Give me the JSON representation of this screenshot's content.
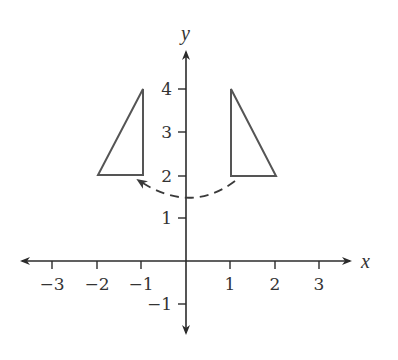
{
  "diagram": {
    "type": "coordinate-plane-reflection",
    "axes": {
      "x_label": "x",
      "y_label": "y",
      "x_ticks": [
        {
          "value": -3,
          "label": "−3"
        },
        {
          "value": -2,
          "label": "−2"
        },
        {
          "value": -1,
          "label": "−1"
        },
        {
          "value": 1,
          "label": "1"
        },
        {
          "value": 2,
          "label": "2"
        },
        {
          "value": 3,
          "label": "3"
        }
      ],
      "y_ticks": [
        {
          "value": 4,
          "label": "4"
        },
        {
          "value": 3,
          "label": "3"
        },
        {
          "value": 2,
          "label": "2"
        },
        {
          "value": 1,
          "label": "1"
        },
        {
          "value": -1,
          "label": "−1"
        }
      ]
    },
    "shapes": [
      {
        "name": "original-triangle",
        "vertices": [
          [
            1,
            4
          ],
          [
            1,
            2
          ],
          [
            2,
            2
          ]
        ]
      },
      {
        "name": "image-triangle",
        "vertices": [
          [
            -1,
            4
          ],
          [
            -1,
            2
          ],
          [
            -2,
            2
          ]
        ]
      }
    ],
    "transformation_arrow": {
      "style": "dashed",
      "from": [
        1,
        1.9
      ],
      "to": [
        -1,
        1.9
      ],
      "direction": "right-to-left"
    },
    "colors": {
      "axis": "#2b2b2b",
      "shape": "#555555",
      "text": "#333333"
    }
  }
}
